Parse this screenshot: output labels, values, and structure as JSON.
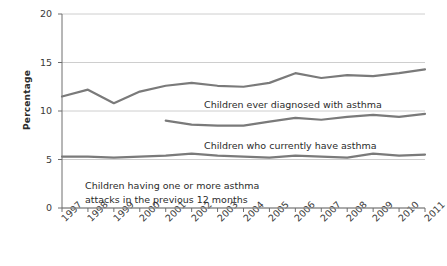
{
  "chart_data": {
    "type": "line",
    "title": "",
    "subtitle": "",
    "xlabel": "",
    "ylabel": "Percentage",
    "x": [
      "1997",
      "1998",
      "1999",
      "2000",
      "2001",
      "2002",
      "2003",
      "2004",
      "2005",
      "2006",
      "2007",
      "2008",
      "2009",
      "2010",
      "2011"
    ],
    "xlim": [
      "1997",
      "2011"
    ],
    "ylim": [
      0,
      20
    ],
    "yticks": [
      0,
      5,
      10,
      15,
      20
    ],
    "ytick_labels": [
      "0",
      "5",
      "10",
      "15",
      "20"
    ],
    "grid": "horizontal",
    "legend_position": "inline-annotations",
    "series": [
      {
        "name": "Children ever diagnosed with asthma",
        "color": "#7a7a7a",
        "x": [
          "1997",
          "1998",
          "1999",
          "2000",
          "2001",
          "2002",
          "2003",
          "2004",
          "2005",
          "2006",
          "2007",
          "2008",
          "2009",
          "2010",
          "2011"
        ],
        "values": [
          11.5,
          12.2,
          10.8,
          12.0,
          12.6,
          12.9,
          12.6,
          12.5,
          12.9,
          13.9,
          13.4,
          13.7,
          13.6,
          13.9,
          14.3
        ]
      },
      {
        "name": "Children who currently have asthma",
        "color": "#7a7a7a",
        "x": [
          "2001",
          "2002",
          "2003",
          "2004",
          "2005",
          "2006",
          "2007",
          "2008",
          "2009",
          "2010",
          "2011"
        ],
        "values": [
          9.0,
          8.6,
          8.5,
          8.5,
          8.9,
          9.3,
          9.1,
          9.4,
          9.6,
          9.4,
          9.7
        ]
      },
      {
        "name": "Children having one or more asthma attacks in the previous 12 months",
        "color": "#7a7a7a",
        "x": [
          "1997",
          "1998",
          "1999",
          "2000",
          "2001",
          "2002",
          "2003",
          "2004",
          "2005",
          "2006",
          "2007",
          "2008",
          "2009",
          "2010",
          "2011"
        ],
        "values": [
          5.3,
          5.3,
          5.2,
          5.3,
          5.4,
          5.6,
          5.4,
          5.3,
          5.2,
          5.4,
          5.3,
          5.2,
          5.6,
          5.4,
          5.5
        ]
      }
    ],
    "annotations": [
      {
        "text": "Children ever diagnosed with asthma",
        "x_px": 204,
        "y_px": 99
      },
      {
        "text": "Children who currently have asthma",
        "x_px": 204,
        "y_px": 140
      },
      {
        "text": "Children having one or more asthma",
        "x_px": 85,
        "y_px": 180
      },
      {
        "text": "attacks in the previous 12 months",
        "x_px": 85,
        "y_px": 194
      }
    ]
  },
  "axis": {
    "y_title": "Percentage"
  },
  "colors": {
    "line": "#7a7a7a",
    "grid": "#c8c8c8",
    "axis": "#6e6e6e",
    "text": "#333333"
  }
}
